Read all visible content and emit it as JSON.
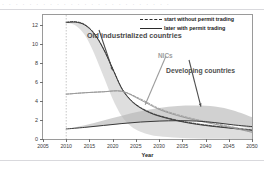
{
  "header": {
    "faint_text": "· · · · · · · · · · · · · · · · · · · · · · · · ·"
  },
  "chart_data": {
    "type": "area",
    "title": "",
    "xlabel": "Year",
    "ylabel": "Tons of annual per capita CO2 emissions",
    "xlim": [
      2005,
      2050
    ],
    "ylim": [
      0,
      13
    ],
    "xticks": [
      2005,
      2010,
      2015,
      2020,
      2025,
      2030,
      2035,
      2040,
      2045,
      2050
    ],
    "yticks": [
      0,
      2,
      4,
      6,
      8,
      10,
      12
    ],
    "grid": false,
    "legend_position": "top-right",
    "start_marker_year": 2010,
    "legend": [
      {
        "key": "dashed",
        "label": "start without permit trading"
      },
      {
        "key": "solid",
        "label": "later with permit trading"
      }
    ],
    "annotations": [
      {
        "label": "Old industrialized countries",
        "color": "#4a4a4a",
        "arrow_to_year": 2020,
        "arrow_to_value": 7.2
      },
      {
        "label": "NICs",
        "color": "#9d9d9d",
        "arrow_to_year": 2027,
        "arrow_to_value": 3.6
      },
      {
        "label": "Developing countries",
        "color": "#4f4f4f",
        "arrow_to_year": 2039,
        "arrow_to_value": 3.4
      }
    ],
    "series": [
      {
        "name": "Old industrialized countries",
        "band": true,
        "x": [
          2010,
          2012,
          2014,
          2016,
          2018,
          2020,
          2022,
          2024,
          2026,
          2028,
          2030,
          2034,
          2038,
          2042,
          2046,
          2050
        ],
        "upper": [
          12.25,
          12.3,
          12.0,
          11.1,
          9.5,
          7.4,
          5.3,
          4.05,
          3.35,
          2.9,
          2.55,
          2.05,
          1.7,
          1.45,
          1.25,
          1.1
        ],
        "lower": [
          12.15,
          11.9,
          10.9,
          9.0,
          6.6,
          4.2,
          2.35,
          1.3,
          0.75,
          0.45,
          0.28,
          0.12,
          0.05,
          0.02,
          0.01,
          0.0
        ],
        "dashed_line": [
          12.25,
          12.3,
          12.0,
          11.1,
          9.5,
          7.4,
          5.3,
          4.05,
          3.3,
          2.8,
          2.45,
          1.95,
          1.6,
          1.35,
          1.15,
          0.95
        ],
        "solid_line": [
          12.2,
          12.25,
          11.95,
          11.05,
          9.45,
          7.35,
          5.25,
          4.0,
          3.25,
          2.75,
          2.4,
          1.9,
          1.55,
          1.3,
          1.1,
          0.9
        ]
      },
      {
        "name": "NICs",
        "band": false,
        "x": [
          2010,
          2014,
          2018,
          2022,
          2026,
          2030,
          2034,
          2038,
          2042,
          2046,
          2050
        ],
        "solid_line": [
          4.7,
          4.85,
          4.95,
          5.0,
          4.1,
          3.1,
          2.45,
          1.95,
          1.55,
          1.15,
          0.7
        ],
        "dashed_line": [
          4.7,
          4.85,
          4.95,
          5.0,
          4.2,
          3.2,
          2.55,
          2.05,
          1.65,
          1.25,
          0.8
        ]
      },
      {
        "name": "Developing countries",
        "band": true,
        "x": [
          2010,
          2014,
          2018,
          2022,
          2026,
          2030,
          2034,
          2038,
          2042,
          2046,
          2050
        ],
        "upper": [
          1.05,
          1.45,
          1.95,
          2.45,
          2.9,
          3.25,
          3.45,
          3.5,
          3.4,
          3.0,
          2.3
        ],
        "lower": [
          1.05,
          1.2,
          1.4,
          1.6,
          1.75,
          1.85,
          1.9,
          1.85,
          1.7,
          1.45,
          1.1
        ],
        "solid_line": [
          1.05,
          1.22,
          1.42,
          1.62,
          1.78,
          1.88,
          1.92,
          1.88,
          1.72,
          1.48,
          1.3
        ]
      }
    ]
  },
  "colors": {
    "band_old": "#c9c9c9",
    "band_dev": "#b4b4b4",
    "line_dark": "#3a3a3a",
    "nics_line": "#9a9a9a",
    "frame": "#9a9a9a",
    "marker_line": "#b9b9b9"
  }
}
